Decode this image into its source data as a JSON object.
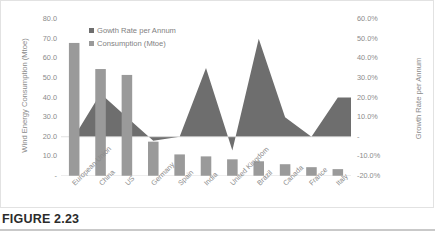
{
  "figure": {
    "caption": "FIGURE 2.23"
  },
  "legend": [
    {
      "label": "Gowth Rate per Annum",
      "color": "#6e6e6e",
      "key": "growth"
    },
    {
      "label": "Consumption (Mtoe)",
      "color": "#9a9a9a",
      "key": "consumption"
    }
  ],
  "axes": {
    "left_title": "Wind Energy Consumption (Mtoe)",
    "right_title": "Growth Rate per Annum",
    "left_ticks": [
      "80.0",
      "70.0",
      "60.0",
      "50.0",
      "40.0",
      "30.0",
      "20.0",
      "10.0",
      "-"
    ],
    "right_ticks": [
      "60.0%",
      "50.0%",
      "40.0%",
      "30.0%",
      "20.0%",
      "10.0%",
      "-",
      "-10.0%",
      "-20.0%"
    ]
  },
  "colors": {
    "bar": "#9a9a9a",
    "area": "#6e6e6e",
    "axis_text": "#8b8b8b",
    "border": "#e2e2e2",
    "baseline": "#d9d9d9",
    "caption_rule": "#c9c9c9"
  },
  "chart_data": {
    "type": "bar",
    "title": "",
    "subtitle": "",
    "xlabel": "",
    "ylabel": "Wind Energy Consumption (Mtoe)",
    "y2label": "Growth Rate per Annum",
    "ylim": [
      0,
      80
    ],
    "y2lim": [
      -20,
      60
    ],
    "ytick_step": 10,
    "y2tick_step": 10,
    "grid": false,
    "legend_position": "top-left",
    "categories": [
      "European Union",
      "China",
      "US",
      "Germany",
      "Spain",
      "India",
      "United Kingdom",
      "Brazil",
      "Canada",
      "France",
      "Italy"
    ],
    "series": [
      {
        "name": "Consumption (Mtoe)",
        "type": "bar",
        "axis": "left",
        "unit": "Mtoe",
        "values": [
          67.8,
          54.5,
          51.5,
          17.5,
          11.0,
          10.0,
          8.5,
          7.5,
          6.0,
          4.5,
          3.5
        ]
      },
      {
        "name": "Gowth Rate per Annum",
        "type": "area",
        "axis": "right",
        "unit": "%",
        "values": [
          0.0,
          22.0,
          10.0,
          -2.0,
          0.0,
          35.0,
          -7.0,
          50.0,
          10.0,
          0.0,
          20.0
        ]
      }
    ]
  }
}
